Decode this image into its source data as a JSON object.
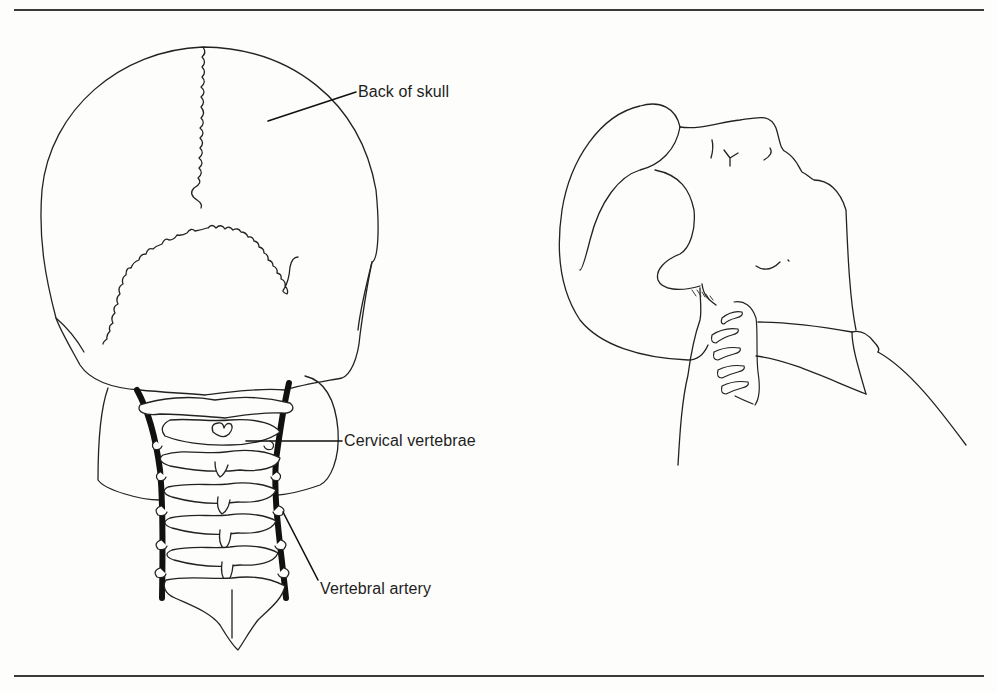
{
  "figure": {
    "left_panel": {
      "title": "Posterior view of skull and cervical spine",
      "labels": [
        {
          "id": "back-of-skull",
          "text": "Back of skull"
        },
        {
          "id": "cervical-vertebrae",
          "text": "Cervical vertebrae"
        },
        {
          "id": "vertebral-artery",
          "text": "Vertebral artery"
        }
      ]
    },
    "right_panel": {
      "title": "Side view of head tilted back showing neck vertebrae"
    }
  },
  "colors": {
    "ink": "#1e1e1e",
    "paper": "#fdfdfb",
    "artery": "#111111"
  }
}
